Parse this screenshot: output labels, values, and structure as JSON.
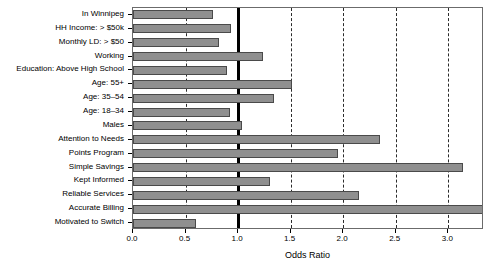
{
  "chart_data": {
    "type": "bar",
    "orientation": "horizontal",
    "title": "",
    "subtitle": "",
    "xlabel": "Odds Ratio",
    "ylabel": "",
    "xlim": [
      0.0,
      3.34
    ],
    "xticks": [
      0.0,
      0.5,
      1.0,
      1.5,
      2.0,
      2.5,
      3.0
    ],
    "xtick_labels": [
      "0.0",
      "0.5",
      "1.0",
      "1.5",
      "2.0",
      "2.5",
      "3.0"
    ],
    "grid": "vertical dashed at every 0.5",
    "reference_line": 1.0,
    "legend": "none",
    "bar_color": "#8f8f8f",
    "bar_edge_color": "#4a4a4a",
    "categories": [
      "In Winnipeg",
      "HH Income: > $50k",
      "Monthly LD: > $50",
      "Working",
      "Education: Above High School",
      "Age: 55+",
      "Age: 35–54",
      "Age: 18–34",
      "Males",
      "Attention to Needs",
      "Points Program",
      "Simple Savings",
      "Kept Informed",
      "Reliable Services",
      "Accurate Billing",
      "Motivated to Switch"
    ],
    "values": [
      0.76,
      0.93,
      0.82,
      1.24,
      0.89,
      1.51,
      1.34,
      0.92,
      1.04,
      2.35,
      1.95,
      3.14,
      1.3,
      2.15,
      3.34,
      0.6
    ]
  }
}
